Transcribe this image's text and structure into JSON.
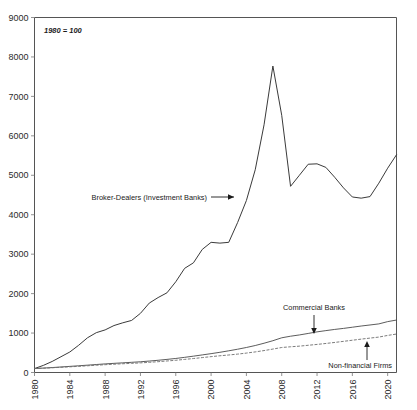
{
  "chart_data": {
    "type": "line",
    "title": "",
    "subtitle": "",
    "note": "1980 = 100",
    "xlabel": "",
    "ylabel": "",
    "xlim": [
      1980,
      2021
    ],
    "ylim": [
      0,
      9000
    ],
    "grid": false,
    "legend_position": "inline-annotations",
    "y_ticks": [
      0,
      1000,
      2000,
      3000,
      4000,
      5000,
      6000,
      7000,
      8000,
      9000
    ],
    "y_tick_labels": [
      "0",
      "1000",
      "2000",
      "3000",
      "4000",
      "5000",
      "6000",
      "7000",
      "8000",
      "9000"
    ],
    "x_ticks": [
      1980,
      1984,
      1988,
      1992,
      1996,
      2000,
      2004,
      2008,
      2012,
      2016,
      2020
    ],
    "x_tick_labels": [
      "1980",
      "1984",
      "1988",
      "1992",
      "1996",
      "2000",
      "2004",
      "2008",
      "2012",
      "2016",
      "2020"
    ],
    "x": [
      1980,
      1981,
      1982,
      1983,
      1984,
      1985,
      1986,
      1987,
      1988,
      1989,
      1990,
      1991,
      1992,
      1993,
      1994,
      1995,
      1996,
      1997,
      1998,
      1999,
      2000,
      2001,
      2002,
      2003,
      2004,
      2005,
      2006,
      2007,
      2008,
      2009,
      2010,
      2011,
      2012,
      2013,
      2014,
      2015,
      2016,
      2017,
      2018,
      2019,
      2020,
      2021
    ],
    "series": [
      {
        "name": "Broker-Dealers (Investment Banks)",
        "style": "solid",
        "values": [
          100,
          180,
          280,
          400,
          520,
          690,
          880,
          1010,
          1080,
          1190,
          1260,
          1320,
          1500,
          1760,
          1900,
          2020,
          2300,
          2640,
          2780,
          3120,
          3300,
          3280,
          3300,
          3800,
          4360,
          5140,
          6280,
          7770,
          6520,
          4720,
          5000,
          5280,
          5290,
          5200,
          4950,
          4680,
          4450,
          4420,
          4460,
          4800,
          5180,
          5520
        ]
      },
      {
        "name": "Commercial Banks",
        "style": "solid-thin",
        "values": [
          100,
          112,
          125,
          140,
          155,
          170,
          186,
          202,
          218,
          232,
          245,
          258,
          272,
          290,
          310,
          332,
          356,
          384,
          414,
          446,
          478,
          512,
          550,
          590,
          634,
          684,
          742,
          806,
          880,
          920,
          952,
          990,
          1030,
          1062,
          1092,
          1118,
          1148,
          1178,
          1205,
          1232,
          1290,
          1330
        ]
      },
      {
        "name": "Non-financial Firms",
        "style": "dashed",
        "values": [
          100,
          110,
          120,
          132,
          144,
          156,
          170,
          184,
          198,
          210,
          222,
          232,
          244,
          258,
          274,
          292,
          310,
          332,
          354,
          378,
          402,
          424,
          444,
          466,
          492,
          522,
          556,
          594,
          634,
          652,
          668,
          690,
          712,
          736,
          762,
          790,
          818,
          846,
          872,
          898,
          940,
          975
        ]
      }
    ],
    "annotations": [
      {
        "name": "broker-dealers-annotation",
        "text": "Broker-Dealers (Investment Banks)",
        "leader": "arrow-right"
      },
      {
        "name": "commercial-banks-annotation",
        "text": "Commercial Banks",
        "leader": "arrow-down"
      },
      {
        "name": "non-financial-firms-annotation",
        "text": "Non-financial Firms",
        "leader": "arrow-up"
      }
    ],
    "colors": {
      "series_primary": "#3a3a3a",
      "series_secondary": "#4a4a4a",
      "series_tertiary": "#6d6d6d",
      "axis": "#555555",
      "text": "#1a1a1a",
      "background": "#ffffff"
    }
  }
}
